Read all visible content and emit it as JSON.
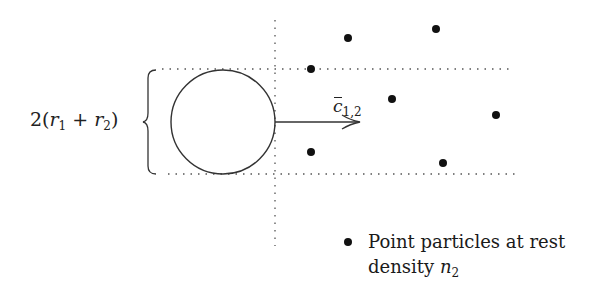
{
  "diagram": {
    "width_label": {
      "prefix": "2(",
      "r1": "r",
      "r1_sub": "1",
      "plus": " + ",
      "r2": "r",
      "r2_sub": "2",
      "suffix": ")"
    },
    "velocity_label": {
      "symbol": "c",
      "subscript": "1,2"
    },
    "legend": {
      "line1": "Point particles at rest",
      "line2_text": "density ",
      "line2_symbol": "n",
      "line2_sub": "2"
    },
    "colors": {
      "stroke": "#333333",
      "dots": "#111111",
      "dotted": "#555555"
    },
    "geometry": {
      "circle": {
        "cx": 223,
        "cy": 122,
        "r": 52
      },
      "top_line_y": 69,
      "bottom_line_y": 174,
      "vertical_line_x": 275,
      "arrow": {
        "x1": 275,
        "x2": 360,
        "y": 122
      },
      "particles": [
        {
          "x": 348,
          "y": 38
        },
        {
          "x": 436,
          "y": 29
        },
        {
          "x": 311,
          "y": 69
        },
        {
          "x": 392,
          "y": 99
        },
        {
          "x": 496,
          "y": 115
        },
        {
          "x": 311,
          "y": 152
        },
        {
          "x": 443,
          "y": 163
        }
      ]
    }
  }
}
